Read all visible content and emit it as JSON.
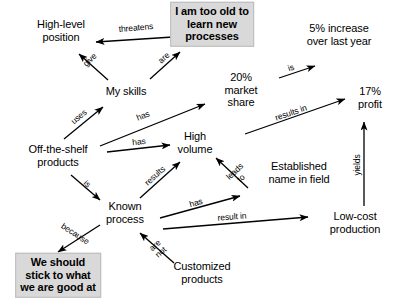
{
  "diagram": {
    "background_color": "#ffffff",
    "line_color": "#000000",
    "boxed_node_fill": "#d9d9d9",
    "nodes": [
      {
        "id": "high_level_position",
        "label": "High-level\nposition",
        "x": 61,
        "y": 30,
        "boxed": false
      },
      {
        "id": "too_old",
        "label": "I am too old to\nlearn new\nprocesses",
        "x": 212,
        "y": 24,
        "boxed": true
      },
      {
        "id": "five_percent_increase",
        "label": "5% increase\nover last year",
        "x": 339,
        "y": 34,
        "boxed": false
      },
      {
        "id": "my_skills",
        "label": "My skills",
        "x": 126,
        "y": 91,
        "boxed": false
      },
      {
        "id": "twenty_percent_market_share",
        "label": "20%\nmarket\nshare",
        "x": 241,
        "y": 90,
        "boxed": false
      },
      {
        "id": "seventeen_percent_profit",
        "label": "17%\nprofit",
        "x": 370,
        "y": 97,
        "boxed": false
      },
      {
        "id": "off_the_shelf_products",
        "label": "Off-the-shelf\nproducts",
        "x": 58,
        "y": 155,
        "boxed": false
      },
      {
        "id": "high_volume",
        "label": "High\nvolume",
        "x": 195,
        "y": 142,
        "boxed": false
      },
      {
        "id": "established_name",
        "label": "Established\nname in field",
        "x": 299,
        "y": 172,
        "boxed": false
      },
      {
        "id": "known_process",
        "label": "Known\nprocess",
        "x": 125,
        "y": 212,
        "boxed": false
      },
      {
        "id": "low_cost_production",
        "label": "Low-cost\nproduction",
        "x": 355,
        "y": 222,
        "boxed": false
      },
      {
        "id": "we_should_stick",
        "label": "We should\nstick to what\nwe are good at",
        "x": 58,
        "y": 275,
        "boxed": true
      },
      {
        "id": "customized_products",
        "label": "Customized\nproducts",
        "x": 202,
        "y": 272,
        "boxed": false
      }
    ],
    "edges": [
      {
        "id": "e_threatens",
        "label": "threatens",
        "from": "too_old",
        "to": "high_level_position",
        "x1": 173,
        "y1": 37,
        "x2": 96,
        "y2": 42,
        "lx": 136,
        "ly": 28,
        "angle": -5
      },
      {
        "id": "e_give",
        "label": "give",
        "from": "my_skills",
        "to": "high_level_position",
        "x1": 108,
        "y1": 80,
        "x2": 79,
        "y2": 54,
        "lx": 90,
        "ly": 60,
        "angle": -43
      },
      {
        "id": "e_are",
        "label": "are",
        "from": "my_skills",
        "to": "too_old",
        "x1": 150,
        "y1": 79,
        "x2": 180,
        "y2": 52,
        "lx": 164,
        "ly": 58,
        "angle": -43
      },
      {
        "id": "e_uses",
        "label": "uses",
        "from": "off_the_shelf_products",
        "to": "my_skills",
        "x1": 64,
        "y1": 139,
        "x2": 103,
        "y2": 107,
        "lx": 79,
        "ly": 117,
        "angle": -40
      },
      {
        "id": "e_has_market",
        "label": "has",
        "from": "off_the_shelf_products",
        "to": "twenty_percent_market_share",
        "x1": 100,
        "y1": 146,
        "x2": 205,
        "y2": 104,
        "lx": 143,
        "ly": 116,
        "angle": -21
      },
      {
        "id": "e_has_volume",
        "label": "has",
        "from": "off_the_shelf_products",
        "to": "high_volume",
        "x1": 107,
        "y1": 152,
        "x2": 170,
        "y2": 145,
        "lx": 139,
        "ly": 142,
        "angle": -6
      },
      {
        "id": "e_is_known",
        "label": "is",
        "from": "off_the_shelf_products",
        "to": "known_process",
        "x1": 71,
        "y1": 175,
        "x2": 100,
        "y2": 200,
        "lx": 87,
        "ly": 184,
        "angle": 40
      },
      {
        "id": "e_because",
        "label": "because",
        "from": "known_process",
        "to": "we_should_stick",
        "x1": 100,
        "y1": 225,
        "x2": 58,
        "y2": 252,
        "lx": 75,
        "ly": 234,
        "angle": 33
      },
      {
        "id": "e_results",
        "label": "results",
        "from": "known_process",
        "to": "high_volume",
        "x1": 140,
        "y1": 198,
        "x2": 180,
        "y2": 162,
        "lx": 155,
        "ly": 176,
        "angle": -42
      },
      {
        "id": "e_has_established",
        "label": "has",
        "from": "known_process",
        "to": "established_name",
        "x1": 160,
        "y1": 218,
        "x2": 240,
        "y2": 196,
        "lx": 196,
        "ly": 203,
        "angle": -15
      },
      {
        "id": "e_result_in",
        "label": "result in",
        "from": "known_process",
        "to": "low_cost_production",
        "x1": 163,
        "y1": 229,
        "x2": 308,
        "y2": 217,
        "lx": 232,
        "ly": 217,
        "angle": -5
      },
      {
        "id": "e_are_not",
        "label": "are\nnot",
        "from": "customized_products",
        "to": "known_process",
        "x1": 174,
        "y1": 263,
        "x2": 140,
        "y2": 233,
        "lx": 158,
        "ly": 249,
        "angle": -41
      },
      {
        "id": "e_leads_to",
        "label": "leads\nto",
        "from": "established_name",
        "to": "high_volume",
        "x1": 248,
        "y1": 188,
        "x2": 216,
        "y2": 158,
        "lx": 238,
        "ly": 175,
        "angle": -43
      },
      {
        "id": "e_is_increase",
        "label": "is",
        "from": "twenty_percent_market_share",
        "to": "five_percent_increase",
        "x1": 279,
        "y1": 78,
        "x2": 315,
        "y2": 66,
        "lx": 291,
        "ly": 68,
        "angle": -19
      },
      {
        "id": "e_results_in",
        "label": "results in",
        "from": "high_volume",
        "to": "seventeen_percent_profit",
        "x1": 245,
        "y1": 134,
        "x2": 345,
        "y2": 99,
        "lx": 291,
        "ly": 113,
        "angle": -19
      },
      {
        "id": "e_yields",
        "label": "yields",
        "from": "low_cost_production",
        "to": "seventeen_percent_profit",
        "x1": 364,
        "y1": 206,
        "x2": 364,
        "y2": 122,
        "lx": 357,
        "ly": 165,
        "angle": -90
      }
    ]
  }
}
